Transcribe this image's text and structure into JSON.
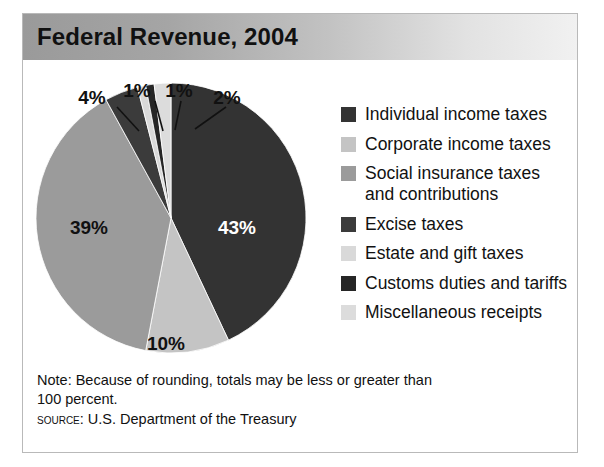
{
  "figure": {
    "title": "Federal Revenue, 2004",
    "note": "Note: Because of rounding, totals may be less or greater than\n100 percent.",
    "source_label": "Source:",
    "source_text": "U.S. Department of the Treasury"
  },
  "colors": {
    "individual": "#333333",
    "corporate": "#c4c4c4",
    "social": "#9b9b9b",
    "excise": "#3b3b3b",
    "estate": "#d9d9d9",
    "customs": "#262626",
    "misc": "#dcdcdc",
    "title_bar_dark": "#9a9a9a",
    "title_bar_light": "#f1f1f1",
    "border": "#b9b9b9",
    "label_dark": "#111111",
    "label_light": "#ffffff"
  },
  "chart_data": {
    "type": "pie",
    "title": "Federal Revenue, 2004",
    "unit": "percent",
    "start_angle_deg": 0,
    "direction": "clockwise",
    "categories": [
      "Individual income taxes",
      "Corporate income taxes",
      "Social insurance taxes and contributions",
      "Excise taxes",
      "Estate and gift taxes",
      "Customs duties and tariffs",
      "Miscellaneous receipts"
    ],
    "values": [
      43,
      10,
      39,
      4,
      1,
      1,
      2
    ],
    "slice_labels": [
      "43%",
      "10%",
      "39%",
      "4%",
      "1%",
      "1%",
      "2%"
    ],
    "slice_colors": [
      "#333333",
      "#c4c4c4",
      "#9b9b9b",
      "#3b3b3b",
      "#d9d9d9",
      "#262626",
      "#dcdcdc"
    ],
    "legend_position": "right",
    "grid": false,
    "total": 100
  },
  "legend": {
    "items": [
      {
        "label": "Individual income taxes",
        "color": "#333333",
        "value": 43
      },
      {
        "label": "Corporate income taxes",
        "color": "#c4c4c4",
        "value": 10
      },
      {
        "label": "Social insurance taxes\nand contributions",
        "color": "#9b9b9b",
        "value": 39
      },
      {
        "label": "Excise taxes",
        "color": "#3b3b3b",
        "value": 4
      },
      {
        "label": "Estate and gift taxes",
        "color": "#d9d9d9",
        "value": 1
      },
      {
        "label": "Customs duties and tariffs",
        "color": "#262626",
        "value": 1
      },
      {
        "label": "Miscellaneous receipts",
        "color": "#dcdcdc",
        "value": 2
      }
    ]
  },
  "pie_labels": {
    "inside": [
      {
        "text": "43%",
        "x": 202,
        "y": 152,
        "tone": "light"
      },
      {
        "text": "39%",
        "x": 54,
        "y": 152,
        "tone": "dark"
      },
      {
        "text": "10%",
        "x": 131,
        "y": 268,
        "tone": "dark"
      }
    ],
    "callouts": [
      {
        "text": "4%",
        "tx": 57,
        "ty": 22,
        "lx1": 82,
        "ly1": 25,
        "lx2": 104,
        "ly2": 49
      },
      {
        "text": "1%",
        "tx": 102,
        "ty": 15,
        "lx1": 120,
        "ly1": 19,
        "lx2": 128,
        "ly2": 49
      },
      {
        "text": "1%",
        "tx": 144,
        "ty": 15,
        "lx1": 146,
        "ly1": 19,
        "lx2": 140,
        "ly2": 48
      },
      {
        "text": "2%",
        "tx": 192,
        "ty": 22,
        "lx1": 191,
        "ly1": 25,
        "lx2": 160,
        "ly2": 47
      }
    ]
  }
}
